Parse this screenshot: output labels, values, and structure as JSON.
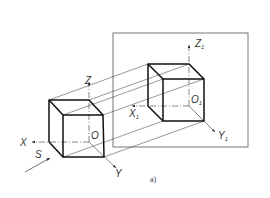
{
  "figure": {
    "caption": "a)",
    "colors": {
      "line": "#222222",
      "frame": "#555555",
      "background": "#ffffff"
    }
  },
  "object_cube": {
    "axes": {
      "x": "X",
      "y": "Y",
      "z": "Z",
      "origin": "O"
    },
    "projection_direction": "S"
  },
  "projection_plane": {
    "axes": {
      "x": "X",
      "y": "Y",
      "z": "Z",
      "origin": "O",
      "subscript": "1"
    }
  }
}
